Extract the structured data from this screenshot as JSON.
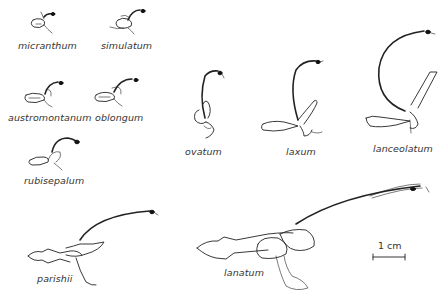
{
  "figure": {
    "type": "botanical illustration",
    "background": "#ffffff",
    "ink_color": "#222222",
    "specimens": [
      {
        "name": "micranthum",
        "label_x": 18,
        "label_y": 40
      },
      {
        "name": "simulatum",
        "label_x": 101,
        "label_y": 40
      },
      {
        "name": "austromontanum",
        "label_x": 8,
        "label_y": 112
      },
      {
        "name": "oblongum",
        "label_x": 95,
        "label_y": 112
      },
      {
        "name": "rubisepalum",
        "label_x": 24,
        "label_y": 175
      },
      {
        "name": "ovatum",
        "label_x": 185,
        "label_y": 146
      },
      {
        "name": "laxum",
        "label_x": 286,
        "label_y": 146
      },
      {
        "name": "lanceolatum",
        "label_x": 373,
        "label_y": 143
      },
      {
        "name": "parishii",
        "label_x": 37,
        "label_y": 273
      },
      {
        "name": "lanatum",
        "label_x": 224,
        "label_y": 267
      }
    ],
    "scale_bar": {
      "label": "1 cm"
    }
  }
}
